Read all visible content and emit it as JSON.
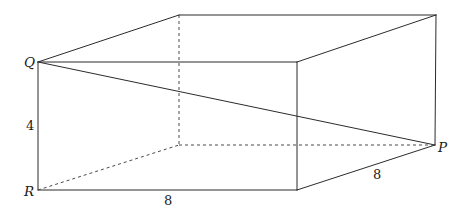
{
  "figure": {
    "type": "geometry-diagram",
    "shape": "rectangular-box",
    "colors": {
      "background": "#ffffff",
      "solid_edge": "#2b2b2b",
      "hidden_edge": "#4a4a4a",
      "label_text": "#1a1a1a"
    },
    "labels": {
      "vertex_q": "Q",
      "vertex_r": "R",
      "vertex_p": "P",
      "height": "4",
      "bottom_depth": "8",
      "right_depth": "8"
    },
    "vertices": {
      "Q": [
        38,
        62
      ],
      "R": [
        38,
        190
      ],
      "front_top_right": [
        297,
        62
      ],
      "front_bottom_right": [
        297,
        190
      ],
      "back_top_left": [
        179,
        15
      ],
      "back_top_right": [
        436,
        15
      ],
      "back_bottom_left_hidden": [
        179,
        145
      ],
      "P": [
        435,
        145
      ]
    },
    "solid_edges": [
      [
        38,
        62,
        297,
        62
      ],
      [
        38,
        62,
        38,
        190
      ],
      [
        38,
        190,
        297,
        190
      ],
      [
        297,
        62,
        297,
        190
      ],
      [
        38,
        62,
        179,
        15
      ],
      [
        179,
        15,
        436,
        15
      ],
      [
        297,
        62,
        436,
        15
      ],
      [
        436,
        15,
        435,
        145
      ],
      [
        297,
        190,
        435,
        145
      ],
      [
        38,
        62,
        435,
        145
      ]
    ],
    "hidden_edges": [
      [
        179,
        15,
        179,
        145
      ],
      [
        179,
        145,
        435,
        145
      ],
      [
        38,
        190,
        179,
        145
      ]
    ]
  }
}
